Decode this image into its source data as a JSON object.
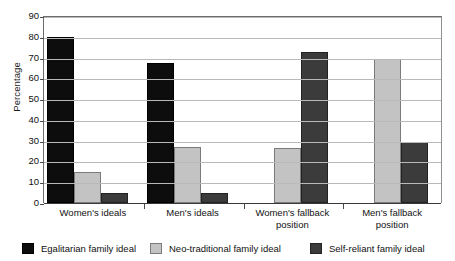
{
  "chart_data": {
    "type": "bar",
    "title": "",
    "xlabel": "",
    "ylabel": "Percentage",
    "ylim": [
      0,
      90
    ],
    "ytick_step": 10,
    "yticks": [
      0,
      10,
      20,
      30,
      40,
      50,
      60,
      70,
      80,
      90
    ],
    "grid": true,
    "legend_position": "bottom",
    "categories": [
      "Women's ideals",
      "Men's ideals",
      "Women's fallback position",
      "Men's fallback position"
    ],
    "series": [
      {
        "name": "Egalitarian family ideal",
        "color": "#0d0d0d",
        "values": [
          80,
          67.5,
          0,
          0
        ]
      },
      {
        "name": "Neo-traditional family ideal",
        "color": "#c3c3c3",
        "values": [
          15,
          27,
          26.5,
          69.5
        ]
      },
      {
        "name": "Self-reliant family ideal",
        "color": "#3b3b3b",
        "values": [
          5,
          5,
          72.5,
          29.5
        ]
      }
    ]
  },
  "axis": {
    "y_title": "Percentage",
    "tick_labels": [
      "90",
      "80",
      "70",
      "60",
      "50",
      "40",
      "30",
      "20",
      "10",
      "0"
    ]
  },
  "category_labels": [
    {
      "line1": "Women's ideals",
      "line2": ""
    },
    {
      "line1": "Men's ideals",
      "line2": ""
    },
    {
      "line1": "Women's fallback",
      "line2": "position"
    },
    {
      "line1": "Men's fallback",
      "line2": "position"
    }
  ],
  "legend": {
    "items": [
      {
        "label": "Egalitarian family ideal",
        "swatch": "black-swatch"
      },
      {
        "label": "Neo-traditional family ideal",
        "swatch": "light-gray-swatch"
      },
      {
        "label": "Self-reliant family ideal",
        "swatch": "dark-gray-swatch"
      }
    ]
  }
}
